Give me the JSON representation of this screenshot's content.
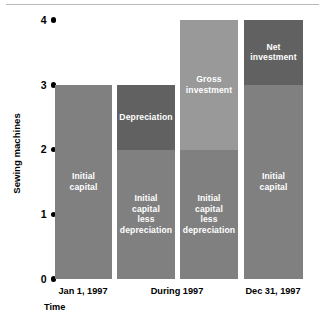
{
  "chart_data": {
    "type": "bar",
    "title": "",
    "subtitle": "",
    "xlabel": "Time",
    "ylabel": "Sewing machines",
    "ylim": [
      0,
      4
    ],
    "yticks": [
      0,
      1,
      2,
      3,
      4
    ],
    "ytick_labels": [
      "0",
      "1",
      "2",
      "3",
      "4"
    ],
    "grid": false,
    "legend": "none",
    "stacked": true,
    "categories": [
      "Jan 1, 1997",
      "During 1997",
      "Dec 31, 1997"
    ],
    "bars": [
      {
        "name": "bar-initial-capital",
        "category": "Jan 1, 1997",
        "total": 3,
        "segments": [
          {
            "label": "Initial\ncapital",
            "from": 0,
            "to": 3,
            "value": 3,
            "color": "#808080"
          }
        ]
      },
      {
        "name": "bar-depreciation",
        "category": "During 1997",
        "total": 3,
        "segments": [
          {
            "label": "Initial\ncapital\nless\ndepreciation",
            "from": 0,
            "to": 2,
            "value": 2,
            "color": "#808080"
          },
          {
            "label": "Depreciation",
            "from": 2,
            "to": 3,
            "value": 1,
            "color": "#616161"
          }
        ]
      },
      {
        "name": "bar-gross-investment",
        "category": "During 1997",
        "total": 4,
        "segments": [
          {
            "label": "Initial\ncapital\nless\ndepreciation",
            "from": 0,
            "to": 2,
            "value": 2,
            "color": "#808080"
          },
          {
            "label": "Gross\ninvestment",
            "from": 2,
            "to": 4,
            "value": 2,
            "color": "#999999"
          }
        ]
      },
      {
        "name": "bar-net-investment",
        "category": "Dec 31, 1997",
        "total": 4,
        "segments": [
          {
            "label": "Initial\ncapital",
            "from": 0,
            "to": 3,
            "value": 3,
            "color": "#808080"
          },
          {
            "label": "Net\ninvestment",
            "from": 3,
            "to": 4,
            "value": 1,
            "color": "#616161"
          }
        ]
      }
    ],
    "colors": {
      "initial_capital": "#808080",
      "gross_investment": "#999999",
      "depreciation_and_net_investment": "#616161",
      "text_on_bar": "#ffffff",
      "axis_text": "#000000",
      "top_rule": "#b9b9b9"
    }
  },
  "axis": {
    "y_title": "Sewing machines",
    "x_title": "Time",
    "ticks": [
      {
        "value": 4,
        "label": "4"
      },
      {
        "value": 3,
        "label": "3"
      },
      {
        "value": 2,
        "label": "2"
      },
      {
        "value": 1,
        "label": "1"
      },
      {
        "value": 0,
        "label": "0"
      }
    ]
  },
  "x_categories": [
    {
      "label": "Jan 1, 1997",
      "center": 83
    },
    {
      "label": "During 1997",
      "center": 177
    },
    {
      "label": "Dec 31, 1997",
      "center": 273
    }
  ]
}
